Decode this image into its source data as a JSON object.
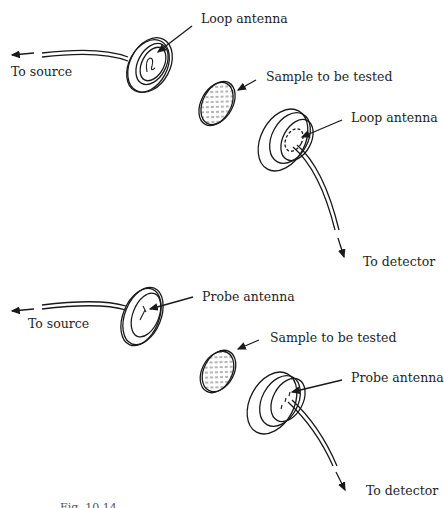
{
  "figure": {
    "top_panel": {
      "name": "loop-antenna-setup",
      "labels": {
        "source_antenna": "Loop antenna",
        "to_source": "To source",
        "sample": "Sample to be tested",
        "detector_antenna": "Loop antenna",
        "to_detector": "To detector"
      }
    },
    "bottom_panel": {
      "name": "probe-antenna-setup",
      "labels": {
        "source_antenna": "Probe antenna",
        "to_source": "To source",
        "sample": "Sample to be tested",
        "detector_antenna": "Probe antenna",
        "to_detector": "To detector"
      }
    },
    "caption": "Fig. 10.14"
  }
}
